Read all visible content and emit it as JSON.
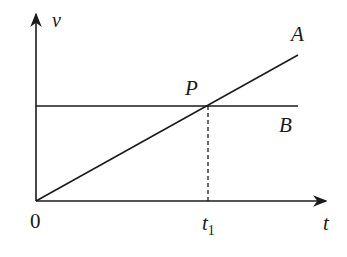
{
  "diagram": {
    "type": "velocity-time graph",
    "axes": {
      "y_label": "v",
      "x_label": "t",
      "origin_label": "0"
    },
    "lines": [
      {
        "name": "A",
        "label": "A",
        "kind": "straight line through origin, increasing"
      },
      {
        "name": "B",
        "label": "B",
        "kind": "horizontal line, constant velocity"
      }
    ],
    "intersection": {
      "label": "P"
    },
    "time_marker": {
      "label": "t",
      "subscript": "1"
    },
    "colors": {
      "stroke": "#1a1a1a",
      "background": "#ffffff"
    }
  }
}
